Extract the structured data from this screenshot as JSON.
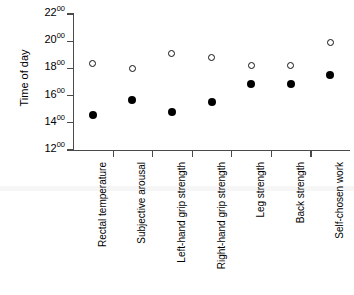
{
  "chart_data": {
    "type": "scatter",
    "title": "",
    "xlabel": "",
    "ylabel": "Time of day",
    "categories": [
      "Rectal temperature",
      "Subjective arousal",
      "Left-hand grip strength",
      "Right-hand grip strength",
      "Leg strength",
      "Back strength",
      "Self-chosen work"
    ],
    "ylim": [
      12,
      22
    ],
    "ytick_values": [
      22,
      20,
      18,
      16,
      14,
      12
    ],
    "ytick_labels": [
      {
        "hh": "22",
        "mm": "00"
      },
      {
        "hh": "20",
        "mm": "00"
      },
      {
        "hh": "18",
        "mm": "00"
      },
      {
        "hh": "16",
        "mm": "00"
      },
      {
        "hh": "14",
        "mm": "00"
      },
      {
        "hh": "12",
        "mm": "00"
      }
    ],
    "grid": false,
    "legend": "none",
    "series": [
      {
        "name": "Open circle (later time)",
        "marker": "open-circle",
        "color": "#111111",
        "values": [
          18.37,
          17.98,
          19.13,
          18.8,
          18.18,
          18.18,
          19.9
        ],
        "value_labels": [
          "18:22",
          "17:59",
          "19:08",
          "18:48",
          "18:11",
          "18:11",
          "19:54"
        ]
      },
      {
        "name": "Filled circle (earlier time)",
        "marker": "filled-circle",
        "color": "#000000",
        "values": [
          14.58,
          15.7,
          14.77,
          15.52,
          16.88,
          16.88,
          17.55
        ],
        "value_labels": [
          "14:35",
          "15:42",
          "14:46",
          "15:31",
          "16:53",
          "16:53",
          "17:33"
        ]
      }
    ]
  }
}
